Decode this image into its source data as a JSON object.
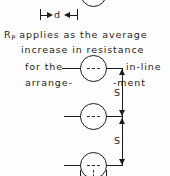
{
  "figure": {
    "caption_lines": [
      {
        "id": "line1_a",
        "text": "R"
      },
      {
        "id": "line1_sub",
        "text": "P"
      },
      {
        "id": "line1_b",
        "text": "applies as the average"
      },
      {
        "id": "line2",
        "text": "increase  in resistance"
      },
      {
        "id": "line3_left",
        "text": "for the"
      },
      {
        "id": "line3_right",
        "text": "in-line"
      },
      {
        "id": "line4_left",
        "text": "arrange-"
      },
      {
        "id": "line4_right",
        "text": "-ment"
      }
    ],
    "text": {
      "rp_symbol": "R",
      "rp_subscript": "P",
      "line1_rest": "applies as the average",
      "line2": "increase  in resistance",
      "line3_left": "for the",
      "line3_right": "in-line",
      "line4_left": "arrange-",
      "line4_right": "-ment"
    },
    "dimensions": [
      {
        "name": "tube-diameter",
        "label": "d"
      },
      {
        "name": "pitch-upper",
        "label": "S"
      },
      {
        "name": "pitch-lower",
        "label": "S"
      }
    ],
    "dimension_labels": {
      "d": "d",
      "s_upper": "S",
      "s_lower": "S"
    },
    "tubes": [
      {
        "name": "tube-top-partial",
        "cx": 93,
        "cy": -6,
        "r": 13
      },
      {
        "name": "tube-1",
        "cx": 93,
        "cy": 68,
        "r": 13
      },
      {
        "name": "tube-2",
        "cx": 93,
        "cy": 116,
        "r": 13
      },
      {
        "name": "tube-3",
        "cx": 93,
        "cy": 165,
        "r": 13
      }
    ],
    "colors": {
      "ink": "#1c1c1c",
      "text": "#232323",
      "background": "#fefefe"
    }
  }
}
